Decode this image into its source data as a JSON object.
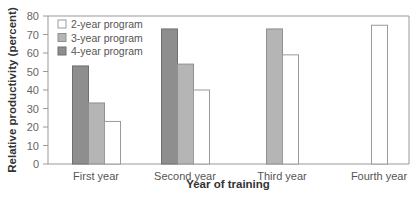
{
  "chart_data": {
    "type": "bar",
    "title": "",
    "xlabel": "Year of training",
    "ylabel": "Relative productivity (percent)",
    "ylim": [
      0,
      80
    ],
    "yticks": [
      0,
      10,
      20,
      30,
      40,
      50,
      60,
      70,
      80
    ],
    "grid": false,
    "legend_position": "upper-left",
    "categories": [
      "First year",
      "Second year",
      "Third year",
      "Fourth year"
    ],
    "series": [
      {
        "name": "4-year program",
        "color": "#8e8e8e",
        "stroke": "#6f6f6f",
        "values": [
          53,
          73,
          null,
          null
        ]
      },
      {
        "name": "3-year program",
        "color": "#b5b5b5",
        "stroke": "#8f8f8f",
        "values": [
          33,
          54,
          73,
          null
        ]
      },
      {
        "name": "2-year program",
        "color": "#ffffff",
        "stroke": "#9a9a9a",
        "values": [
          23,
          40,
          59,
          75
        ]
      }
    ],
    "legend_order": [
      "2-year program",
      "3-year program",
      "4-year program"
    ]
  }
}
